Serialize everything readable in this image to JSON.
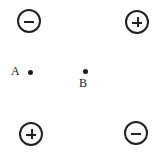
{
  "diagram": {
    "background_color": "#ffffff",
    "stroke_color": "#231f20",
    "dot_color": "#1a1a1a",
    "width": 165,
    "height": 158,
    "charges": [
      {
        "id": "top-left",
        "sign": "−",
        "polarity": "negative",
        "icon": "minus-circle-icon",
        "center_x": 29,
        "center_y": 21,
        "radius": 12
      },
      {
        "id": "top-right",
        "sign": "+",
        "polarity": "positive",
        "icon": "plus-circle-icon",
        "center_x": 137,
        "center_y": 22,
        "radius": 12
      },
      {
        "id": "bottom-left",
        "sign": "+",
        "polarity": "positive",
        "icon": "plus-circle-icon",
        "center_x": 31,
        "center_y": 134,
        "radius": 12
      },
      {
        "id": "bottom-right",
        "sign": "−",
        "polarity": "negative",
        "icon": "minus-circle-icon",
        "center_x": 136,
        "center_y": 133,
        "radius": 12
      }
    ],
    "points": [
      {
        "id": "a",
        "label": "A",
        "label_position": "left",
        "center_x": 30,
        "center_y": 72,
        "dot_diameter": 5
      },
      {
        "id": "b",
        "label": "B",
        "label_position": "below",
        "center_x": 85,
        "center_y": 71,
        "dot_diameter": 5
      }
    ]
  }
}
